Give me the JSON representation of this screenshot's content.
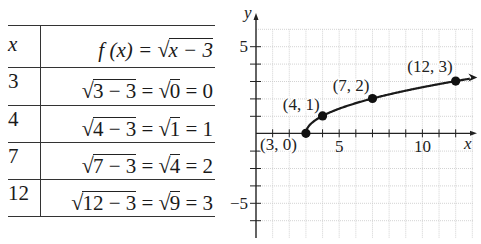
{
  "table": {
    "header": {
      "x": "x",
      "fx_prefix": "f (x) = ",
      "fx_radical": "x − 3"
    },
    "rows": [
      {
        "x": "3",
        "rad1": "3 − 3",
        "rad2": "0",
        "result": "0"
      },
      {
        "x": "4",
        "rad1": "4 − 3",
        "rad2": "1",
        "result": "1"
      },
      {
        "x": "7",
        "rad1": "7 − 3",
        "rad2": "4",
        "result": "2"
      },
      {
        "x": "12",
        "rad1": "12 − 3",
        "rad2": "9",
        "result": "3"
      }
    ],
    "sqrt_symbol": "√",
    "eq": " = "
  },
  "chart_data": {
    "type": "line",
    "title": "",
    "function": "f(x) = sqrt(x - 3)",
    "xlabel": "x",
    "ylabel": "y",
    "x_tick_labels": [
      {
        "value": 5,
        "label": "5"
      },
      {
        "value": 10,
        "label": "10"
      }
    ],
    "y_tick_labels": [
      {
        "value": 5,
        "label": "5"
      },
      {
        "value": -4,
        "label": "−5"
      }
    ],
    "xlim": [
      0,
      13
    ],
    "ylim": [
      -6,
      6
    ],
    "grid": true,
    "points": [
      {
        "x": 3,
        "y": 0,
        "label": "(3, 0)"
      },
      {
        "x": 4,
        "y": 1,
        "label": "(4, 1)"
      },
      {
        "x": 7,
        "y": 2,
        "label": "(7, 2)"
      },
      {
        "x": 12,
        "y": 3,
        "label": "(12, 3)"
      }
    ],
    "arrow_at_end": true
  }
}
